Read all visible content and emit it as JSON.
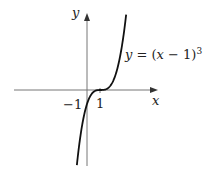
{
  "chart_data": {
    "type": "line",
    "title": "",
    "function": "y = (x - 1)^3",
    "xlabel": "x",
    "ylabel": "y",
    "annotations": [
      {
        "text": "y = (x − 1)³",
        "near": "upper-right branch of curve"
      },
      {
        "text": "−1",
        "position": "y-intercept on negative y-axis"
      },
      {
        "text": "1",
        "position": "x-intercept on positive x-axis"
      }
    ],
    "key_points": [
      {
        "x": 1,
        "y": 0,
        "label": "1"
      },
      {
        "x": 0,
        "y": -1,
        "label": "-1"
      }
    ],
    "series": [
      {
        "name": "y = (x - 1)^3",
        "x": [
          -0.75,
          -0.5,
          -0.25,
          0,
          0.25,
          0.5,
          0.75,
          1,
          1.25,
          1.5,
          1.75,
          2,
          2.25,
          2.5,
          2.75,
          2.9
        ],
        "values": [
          -5.36,
          -3.38,
          -1.95,
          -1,
          -0.42,
          -0.13,
          -0.02,
          0,
          0.02,
          0.13,
          0.42,
          1,
          1.95,
          3.38,
          5.36,
          6.86
        ]
      }
    ],
    "xlim": [
      -5.5,
      5.2
    ],
    "ylim": [
      -6,
      6.2
    ],
    "grid": false,
    "legend": "none"
  },
  "labels": {
    "y_axis": "y",
    "x_axis": "x",
    "tick_neg1": "−1",
    "tick_1": "1",
    "eq_y": "y",
    "eq_rest": " = (",
    "eq_x": "x",
    "eq_tail": " − 1)",
    "eq_exp": "3"
  }
}
